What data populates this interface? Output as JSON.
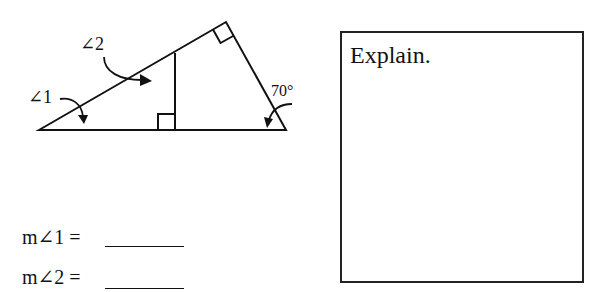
{
  "diagram": {
    "angle1_label": "∠1",
    "angle2_label": "∠2",
    "given_angle_label": "70°",
    "vertices": {
      "bottom_left": [
        39,
        130
      ],
      "top": [
        226,
        22
      ],
      "bottom_right": [
        286,
        130
      ],
      "altitude_top": [
        175,
        53
      ],
      "altitude_foot": [
        175,
        130
      ]
    },
    "right_angle_marks": [
      "top vertex",
      "altitude foot"
    ]
  },
  "answers": [
    {
      "label": "m∠1 =",
      "value": ""
    },
    {
      "label": "m∠2 =",
      "value": ""
    }
  ],
  "explain": {
    "label": "Explain.",
    "value": ""
  },
  "colors": {
    "ink": "#111111",
    "background": "#ffffff"
  }
}
